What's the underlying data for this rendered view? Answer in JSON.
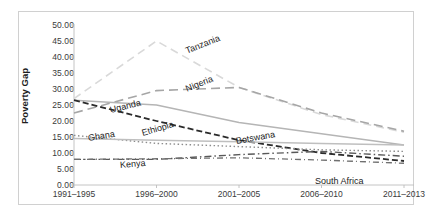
{
  "chart_data": {
    "type": "line",
    "title": "",
    "xlabel": "",
    "ylabel": "Poverty Gap",
    "categories": [
      "1991–1995",
      "1996–2000",
      "2001–2005",
      "2006–2010",
      "2011–2013"
    ],
    "ylim": [
      0,
      50
    ],
    "ytick_step": 5,
    "yticks": [
      "0.00",
      "5.00",
      "10.00",
      "15.00",
      "20.00",
      "25.00",
      "30.00",
      "35.00",
      "40.00",
      "45.00",
      "50.00"
    ],
    "grid": false,
    "legend": "inline-series-labels",
    "series": [
      {
        "name": "Tanzania",
        "values": [
          27.0,
          45.0,
          30.5,
          22.0,
          16.5
        ],
        "color": "#d9d9d9",
        "dash": "8,5",
        "width": 1.6
      },
      {
        "name": "Nigeria",
        "values": [
          22.5,
          29.5,
          30.5,
          22.5,
          16.8
        ],
        "color": "#a6a6a6",
        "dash": "9,5",
        "width": 1.6
      },
      {
        "name": "Uganda",
        "values": [
          26.5,
          25.0,
          19.5,
          16.0,
          12.5
        ],
        "color": "#b5b5b5",
        "dash": "none",
        "width": 1.5
      },
      {
        "name": "Ethiopia",
        "values": [
          26.5,
          20.0,
          14.0,
          10.0,
          7.5
        ],
        "color": "#2b2b2b",
        "dash": "6,3",
        "width": 1.8
      },
      {
        "name": "Ghana",
        "values": [
          15.5,
          13.0,
          12.0,
          11.0,
          10.5
        ],
        "color": "#8c8c8c",
        "dash": "1.5,2.5",
        "width": 1.4
      },
      {
        "name": "Kenya",
        "values": [
          8.0,
          8.0,
          9.5,
          10.5,
          9.0
        ],
        "color": "#595959",
        "dash": "7,3,1.5,3",
        "width": 1.4
      },
      {
        "name": "Botswana",
        "values": [
          14.5,
          14.0,
          13.5,
          13.0,
          12.5
        ],
        "color": "#bfbfbf",
        "dash": "none",
        "width": 1.5
      },
      {
        "name": "South Africa",
        "values": [
          8.0,
          8.2,
          8.5,
          7.8,
          6.8
        ],
        "color": "#707070",
        "dash": "6,3,1,3",
        "width": 1.3
      }
    ],
    "series_labels": [
      {
        "name": "Tanzania",
        "x": 186,
        "y": 46,
        "rot": -22
      },
      {
        "name": "Nigeria",
        "x": 186,
        "y": 84,
        "rot": -22
      },
      {
        "name": "Uganda",
        "x": 110,
        "y": 105,
        "rot": -14
      },
      {
        "name": "Ethiopia",
        "x": 142,
        "y": 128,
        "rot": -16
      },
      {
        "name": "Ghana",
        "x": 88,
        "y": 133,
        "rot": -9
      },
      {
        "name": "Kenya",
        "x": 120,
        "y": 160,
        "rot": -5
      },
      {
        "name": "Botswana",
        "x": 236,
        "y": 136,
        "rot": -10
      },
      {
        "name": "South Africa",
        "x": 315,
        "y": 176,
        "rot": 0
      }
    ]
  }
}
